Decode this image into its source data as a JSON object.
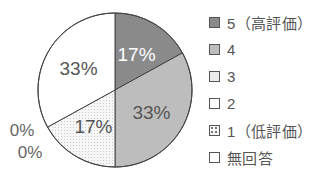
{
  "chart_data": {
    "type": "pie",
    "title": "",
    "categories": [
      "5（高評価）",
      "4",
      "3",
      "2",
      "1（低評価）",
      "無回答"
    ],
    "values": [
      17,
      33,
      17,
      33,
      0,
      0
    ],
    "value_labels": [
      "17%",
      "33%",
      "17%",
      "33%",
      "0%",
      "0%"
    ],
    "unit": "%",
    "start_angle": "12 o'clock",
    "direction": "clockwise",
    "legend_position": "right",
    "colors": [
      "#8a8a8a",
      "#bdbdbd",
      "#ececec",
      "#ffffff",
      "#f6f6f6",
      "#ffffff"
    ],
    "label_colors": [
      "#ffffff",
      "#555555",
      "#555555",
      "#555555",
      "#555555",
      "#555555"
    ]
  },
  "legend": {
    "items": [
      {
        "label": "5（高評価）",
        "color": "#8a8a8a"
      },
      {
        "label": "4",
        "color": "#bdbdbd"
      },
      {
        "label": "3",
        "color": "#ececec"
      },
      {
        "label": "2",
        "color": "#ffffff"
      },
      {
        "label": "1（低評価）",
        "color": "#f6f6f6"
      },
      {
        "label": "無回答",
        "color": "#ffffff"
      }
    ]
  }
}
